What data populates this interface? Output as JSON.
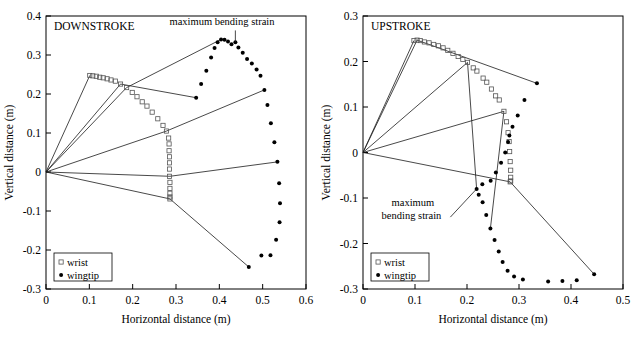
{
  "figure": {
    "panels": [
      "downstroke",
      "upstroke"
    ]
  },
  "chart_data": [
    {
      "type": "scatter",
      "title": "DOWNSTROKE",
      "xlabel": "Horizontal distance (m)",
      "ylabel": "Vertical distance (m)",
      "xlim": [
        0,
        0.6
      ],
      "ylim": [
        -0.3,
        0.4
      ],
      "xticks": [
        "0",
        "0.1",
        "0.2",
        "0.3",
        "0.4",
        "0.5",
        "0.6"
      ],
      "xtick_values": [
        0,
        0.1,
        0.2,
        0.3,
        0.4,
        0.5,
        0.6
      ],
      "yticks": [
        "0.4",
        "0.3",
        "0.2",
        "0.1",
        "0",
        "-0.1",
        "-0.2",
        "-0.3"
      ],
      "ytick_values": [
        0.4,
        0.3,
        0.2,
        0.1,
        0,
        -0.1,
        -0.2,
        -0.3
      ],
      "grid": false,
      "legend_position": "lower-left",
      "legend": [
        {
          "name": "wrist",
          "marker": "open-square"
        },
        {
          "name": "wingtip",
          "marker": "filled-circle"
        }
      ],
      "annotations": [
        {
          "text": "maximum bending strain",
          "text_x": 0.285,
          "text_y": 0.378,
          "pointer_from": [
            0.437,
            0.363
          ],
          "pointer_to": [
            0.437,
            0.333
          ]
        }
      ],
      "series": [
        {
          "name": "wrist",
          "marker": "open-square",
          "points": [
            [
              0.101,
              0.2475
            ],
            [
              0.108,
              0.2465
            ],
            [
              0.116,
              0.2455
            ],
            [
              0.124,
              0.243
            ],
            [
              0.132,
              0.2415
            ],
            [
              0.141,
              0.239
            ],
            [
              0.15,
              0.236
            ],
            [
              0.16,
              0.233
            ],
            [
              0.172,
              0.2255
            ],
            [
              0.186,
              0.2165
            ],
            [
              0.199,
              0.204
            ],
            [
              0.21,
              0.193
            ],
            [
              0.222,
              0.18
            ],
            [
              0.233,
              0.169
            ],
            [
              0.245,
              0.1535
            ],
            [
              0.258,
              0.1365
            ],
            [
              0.27,
              0.1195
            ],
            [
              0.278,
              0.105
            ],
            [
              0.283,
              0.087
            ],
            [
              0.284,
              0.072
            ],
            [
              0.284,
              0.0545
            ],
            [
              0.285,
              0.039
            ],
            [
              0.285,
              0.0235
            ],
            [
              0.285,
              0.0075
            ],
            [
              0.285,
              -0.011
            ],
            [
              0.286,
              -0.0265
            ],
            [
              0.286,
              -0.042
            ],
            [
              0.286,
              -0.0545
            ],
            [
              0.286,
              -0.064
            ],
            [
              0.286,
              -0.069
            ]
          ]
        },
        {
          "name": "wingtip",
          "marker": "filled-circle",
          "points": [
            [
              0.3465,
              0.1905
            ],
            [
              0.358,
              0.2255
            ],
            [
              0.37,
              0.2595
            ],
            [
              0.381,
              0.2935
            ],
            [
              0.389,
              0.318
            ],
            [
              0.396,
              0.333
            ],
            [
              0.404,
              0.34
            ],
            [
              0.412,
              0.339
            ],
            [
              0.42,
              0.3345
            ],
            [
              0.428,
              0.3275
            ],
            [
              0.437,
              0.333
            ],
            [
              0.444,
              0.319
            ],
            [
              0.454,
              0.3055
            ],
            [
              0.464,
              0.29
            ],
            [
              0.475,
              0.278
            ],
            [
              0.486,
              0.263
            ],
            [
              0.495,
              0.247
            ],
            [
              0.504,
              0.2105
            ],
            [
              0.511,
              0.1715
            ],
            [
              0.519,
              0.125
            ],
            [
              0.527,
              0.076
            ],
            [
              0.534,
              0.0265
            ],
            [
              0.538,
              -0.029
            ],
            [
              0.54,
              -0.08
            ],
            [
              0.539,
              -0.129
            ],
            [
              0.531,
              -0.174
            ],
            [
              0.518,
              -0.2135
            ],
            [
              0.497,
              -0.214
            ],
            [
              0.468,
              -0.2435
            ]
          ]
        }
      ],
      "wing_segments": [
        {
          "from": [
            0,
            0
          ],
          "via": [
            0.101,
            0.2475
          ],
          "to": null
        },
        {
          "from": [
            0,
            0
          ],
          "via": [
            0.172,
            0.2255
          ],
          "to": [
            0.3465,
            0.1905
          ]
        },
        {
          "from": [
            0,
            0
          ],
          "via": [
            0.186,
            0.2165
          ],
          "to": [
            0.404,
            0.34
          ]
        },
        {
          "from": [
            0,
            0
          ],
          "via": [
            0.278,
            0.105
          ],
          "to": [
            0.504,
            0.2105
          ]
        },
        {
          "from": [
            0,
            0
          ],
          "via": [
            0.286,
            -0.011
          ],
          "to": [
            0.538,
            0.0265
          ]
        },
        {
          "from": [
            0,
            0
          ],
          "via": [
            0.286,
            -0.069
          ],
          "to": [
            0.468,
            -0.2435
          ]
        }
      ]
    },
    {
      "type": "scatter",
      "title": "UPSTROKE",
      "xlabel": "Horizontal distance (m)",
      "ylabel": "Vertical distance (m)",
      "xlim": [
        0,
        0.5
      ],
      "ylim": [
        -0.3,
        0.3
      ],
      "xticks": [
        "0",
        "0.1",
        "0.2",
        "0.3",
        "0.4",
        "0.5"
      ],
      "xtick_values": [
        0,
        0.1,
        0.2,
        0.3,
        0.4,
        0.5
      ],
      "yticks": [
        "0.3",
        "0.2",
        "0.1",
        "0",
        "-0.1",
        "-0.2",
        "-0.3"
      ],
      "ytick_values": [
        0.3,
        0.2,
        0.1,
        0,
        -0.1,
        -0.2,
        -0.3
      ],
      "grid": false,
      "legend_position": "lower-left",
      "legend": [
        {
          "name": "wrist",
          "marker": "open-square"
        },
        {
          "name": "wingtip",
          "marker": "filled-circle"
        }
      ],
      "annotations": [
        {
          "text_line1": "maximum",
          "text_line2": "bending strain",
          "text_x": 0.055,
          "text_y": -0.118,
          "pointer_from": [
            0.168,
            -0.142
          ],
          "pointer_to": [
            0.2185,
            -0.08
          ]
        }
      ],
      "series": [
        {
          "name": "wrist",
          "marker": "open-square",
          "points": [
            [
              0.098,
              0.246
            ],
            [
              0.104,
              0.247
            ],
            [
              0.11,
              0.246
            ],
            [
              0.118,
              0.243
            ],
            [
              0.127,
              0.241
            ],
            [
              0.136,
              0.2375
            ],
            [
              0.145,
              0.2345
            ],
            [
              0.154,
              0.23
            ],
            [
              0.163,
              0.2245
            ],
            [
              0.173,
              0.218
            ],
            [
              0.183,
              0.211
            ],
            [
              0.192,
              0.2045
            ],
            [
              0.201,
              0.198
            ],
            [
              0.212,
              0.186
            ],
            [
              0.219,
              0.179
            ],
            [
              0.231,
              0.1635
            ],
            [
              0.238,
              0.1545
            ],
            [
              0.247,
              0.1395
            ],
            [
              0.255,
              0.1245
            ],
            [
              0.262,
              0.1155
            ],
            [
              0.271,
              0.0905
            ],
            [
              0.276,
              0.0675
            ],
            [
              0.279,
              0.0435
            ],
            [
              0.281,
              0.024
            ],
            [
              0.282,
              0.002
            ],
            [
              0.283,
              -0.02
            ],
            [
              0.284,
              -0.039
            ],
            [
              0.284,
              -0.0545
            ],
            [
              0.284,
              -0.0625
            ],
            [
              0.283,
              -0.0645
            ]
          ]
        },
        {
          "name": "wingtip",
          "marker": "filled-circle",
          "points": [
            [
              0.3345,
              0.152
            ],
            [
              0.3105,
              0.1155
            ],
            [
              0.2975,
              0.0815
            ],
            [
              0.2875,
              0.0565
            ],
            [
              0.2815,
              0.0375
            ],
            [
              0.279,
              0.023
            ],
            [
              0.2735,
              0.0
            ],
            [
              0.2655,
              -0.0225
            ],
            [
              0.2555,
              -0.044
            ],
            [
              0.2455,
              -0.062
            ],
            [
              0.2295,
              -0.07
            ],
            [
              0.2185,
              -0.08
            ],
            [
              0.2225,
              -0.093
            ],
            [
              0.23,
              -0.1095
            ],
            [
              0.237,
              -0.1375
            ],
            [
              0.245,
              -0.167
            ],
            [
              0.253,
              -0.1925
            ],
            [
              0.261,
              -0.2175
            ],
            [
              0.2685,
              -0.2405
            ],
            [
              0.278,
              -0.26
            ],
            [
              0.2905,
              -0.2725
            ],
            [
              0.3075,
              -0.279
            ],
            [
              0.356,
              -0.2835
            ],
            [
              0.3835,
              -0.2825
            ],
            [
              0.411,
              -0.281
            ],
            [
              0.4445,
              -0.2675
            ]
          ]
        }
      ],
      "wing_segments": [
        {
          "from": [
            0,
            0
          ],
          "via": [
            0.098,
            0.246
          ],
          "to": null
        },
        {
          "from": [
            0,
            0
          ],
          "via": [
            0.104,
            0.247
          ],
          "to": [
            0.3345,
            0.152
          ]
        },
        {
          "from": [
            0,
            0
          ],
          "via": [
            0.201,
            0.198
          ],
          "to": null
        },
        {
          "from": [
            0,
            0
          ],
          "via": [
            0.271,
            0.0905
          ],
          "to": null
        },
        {
          "from": [
            0,
            0
          ],
          "via": [
            0.283,
            -0.0645
          ],
          "to": [
            0.4445,
            -0.2675
          ]
        },
        {
          "from": [
            0.201,
            0.198
          ],
          "via": null,
          "to": [
            0.2185,
            -0.08
          ]
        },
        {
          "from": [
            0.271,
            0.0905
          ],
          "via": null,
          "to": [
            0.245,
            -0.167
          ]
        }
      ]
    }
  ]
}
